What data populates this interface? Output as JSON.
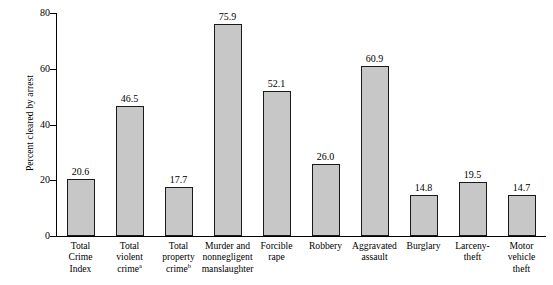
{
  "chart_data": {
    "type": "bar",
    "title": "",
    "subtitle": "",
    "xlabel": "",
    "ylabel": "Percent cleared by arrest",
    "ylim": [
      0,
      80
    ],
    "yticks": [
      0,
      20,
      40,
      60,
      80
    ],
    "grid": false,
    "legend": null,
    "bar_fill_color": "#c7c7c7",
    "bar_edge_color": "#1a1a1a",
    "background_color": "#ffffff",
    "categories": [
      "Total Crime Index",
      "Total violent crime",
      "Total property crime",
      "Murder and nonnegligent manslaughter",
      "Forcible rape",
      "Robbery",
      "Aggravated assault",
      "Burglary",
      "Larceny-theft",
      "Motor vehicle theft"
    ],
    "values": [
      20.6,
      46.5,
      17.7,
      75.9,
      52.1,
      26.0,
      60.9,
      14.8,
      19.5,
      14.7
    ],
    "value_labels": [
      "20.6",
      "46.5",
      "17.7",
      "75.9",
      "52.1",
      "26.0",
      "60.9",
      "14.8",
      "19.5",
      "14.7"
    ],
    "category_label_lines": [
      [
        "Total",
        "Crime",
        "Index"
      ],
      [
        "Total",
        "violent",
        "crime"
      ],
      [
        "Total",
        "property",
        "crime"
      ],
      [
        "Murder and",
        "nonnegligent",
        "manslaughter"
      ],
      [
        "Forcible",
        "rape"
      ],
      [
        "Robbery"
      ],
      [
        "Aggravated",
        "assault"
      ],
      [
        "Burglary"
      ],
      [
        "Larceny-",
        "theft"
      ],
      [
        "Motor",
        "vehicle",
        "theft"
      ]
    ],
    "category_footnotes": [
      "",
      "a",
      "b",
      "",
      "",
      "",
      "",
      "",
      "",
      ""
    ]
  },
  "axis": {
    "y_tick_labels": [
      "0",
      "20",
      "40",
      "60",
      "80"
    ],
    "y_title": "Percent cleared by arrest"
  }
}
